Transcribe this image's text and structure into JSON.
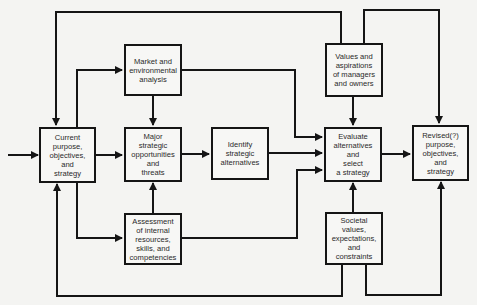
{
  "diagram": {
    "type": "flowchart",
    "title": "",
    "colors": {
      "line": "#151515",
      "background": "#f4f4f2",
      "text": "#2a2a2a"
    },
    "nodes": [
      {
        "id": "current",
        "label": "Current\npurpose,\nobjectives,\nand\nstrategy"
      },
      {
        "id": "market",
        "label": "Market and\nenvironmental\nanalysis"
      },
      {
        "id": "major",
        "label": "Major\nstrategic\nopportunities\nand\nthreats"
      },
      {
        "id": "assessment",
        "label": "Assessment\nof internal\nresources,\nskills, and\ncompetencies"
      },
      {
        "id": "identify",
        "label": "Identify\nstrategic\nalternatives"
      },
      {
        "id": "values",
        "label": "Values and\naspirations\nof managers\nand owners"
      },
      {
        "id": "evaluate",
        "label": "Evaluate\nalternatives\nand\nselect\na strategy"
      },
      {
        "id": "societal",
        "label": "Societal\nvalues,\nexpectations,\nand\nconstraints"
      },
      {
        "id": "revised",
        "label": "Revised(?)\npurpose,\nobjectives,\nand\nstrategy"
      }
    ],
    "edges": [
      {
        "from": "input",
        "to": "current"
      },
      {
        "from": "current",
        "to": "market"
      },
      {
        "from": "current",
        "to": "major"
      },
      {
        "from": "current",
        "to": "assessment"
      },
      {
        "from": "market",
        "to": "major"
      },
      {
        "from": "market",
        "to": "evaluate"
      },
      {
        "from": "assessment",
        "to": "major"
      },
      {
        "from": "assessment",
        "to": "evaluate"
      },
      {
        "from": "major",
        "to": "identify"
      },
      {
        "from": "identify",
        "to": "evaluate"
      },
      {
        "from": "values",
        "to": "evaluate"
      },
      {
        "from": "values",
        "to": "current"
      },
      {
        "from": "values",
        "to": "revised"
      },
      {
        "from": "societal",
        "to": "evaluate"
      },
      {
        "from": "societal",
        "to": "current"
      },
      {
        "from": "societal",
        "to": "revised"
      },
      {
        "from": "evaluate",
        "to": "revised"
      }
    ]
  }
}
